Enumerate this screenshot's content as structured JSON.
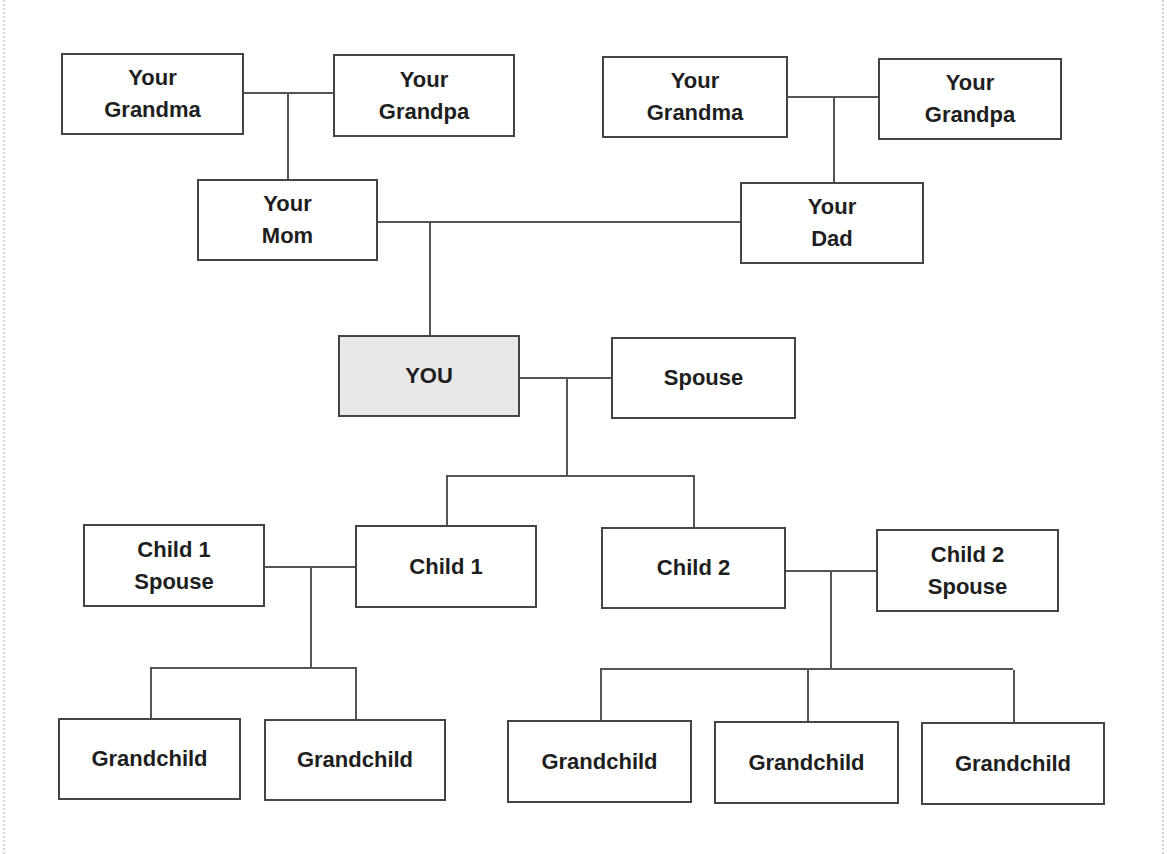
{
  "diagram": {
    "type": "family-tree",
    "colors": {
      "border": "#444444",
      "line": "#555555",
      "you_fill": "#e8e8e8",
      "background": "#ffffff"
    },
    "generations": {
      "grandparents": {
        "maternal_grandma": {
          "line1": "Your",
          "line2": "Grandma"
        },
        "maternal_grandpa": {
          "line1": "Your",
          "line2": "Grandpa"
        },
        "paternal_grandma": {
          "line1": "Your",
          "line2": "Grandma"
        },
        "paternal_grandpa": {
          "line1": "Your",
          "line2": "Grandpa"
        }
      },
      "parents": {
        "mom": {
          "line1": "Your",
          "line2": "Mom"
        },
        "dad": {
          "line1": "Your",
          "line2": "Dad"
        }
      },
      "self": {
        "you": {
          "line1": "YOU"
        },
        "spouse": {
          "line1": "Spouse"
        }
      },
      "children": {
        "child1_spouse": {
          "line1": "Child 1",
          "line2": "Spouse"
        },
        "child1": {
          "line1": "Child 1"
        },
        "child2": {
          "line1": "Child 2"
        },
        "child2_spouse": {
          "line1": "Child 2",
          "line2": "Spouse"
        }
      },
      "grandchildren": [
        {
          "label": "Grandchild"
        },
        {
          "label": "Grandchild"
        },
        {
          "label": "Grandchild"
        },
        {
          "label": "Grandchild"
        },
        {
          "label": "Grandchild"
        }
      ]
    }
  }
}
